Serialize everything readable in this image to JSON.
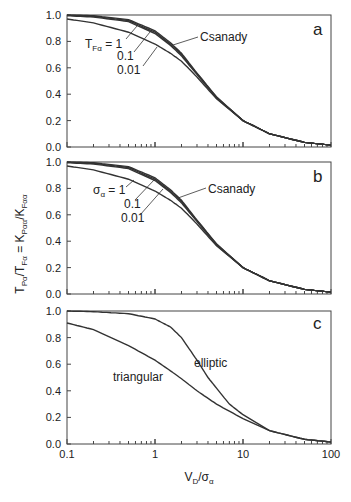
{
  "chart_data": [
    {
      "panel": "a",
      "type": "line",
      "xscale": "log",
      "xlim": [
        0.1,
        100
      ],
      "ylim": [
        0,
        1
      ],
      "yticks": [
        "0.0",
        "0.2",
        "0.4",
        "0.6",
        "0.8",
        "1.0"
      ],
      "xlabel": "V_D/σ_α",
      "ylabel": "T_Pα/T_Fα = K_Pαα/K_Fαα",
      "legend_title": "T_Fα = 1",
      "annotations": [
        "T_Fα = 1",
        "0.1",
        "0.01",
        "Csanady"
      ],
      "series": [
        {
          "name": "Csanady",
          "x": [
            0.1,
            0.2,
            0.5,
            1,
            1.5,
            2,
            3,
            5,
            10,
            20,
            50,
            100
          ],
          "y": [
            1.0,
            0.995,
            0.965,
            0.88,
            0.79,
            0.71,
            0.56,
            0.38,
            0.2,
            0.1,
            0.035,
            0.015
          ]
        },
        {
          "name": "T_Fα = 1",
          "x": [
            0.1,
            0.2,
            0.5,
            1,
            1.5,
            2,
            3,
            5,
            10,
            20,
            50,
            100
          ],
          "y": [
            0.998,
            0.99,
            0.958,
            0.87,
            0.78,
            0.7,
            0.555,
            0.375,
            0.2,
            0.1,
            0.035,
            0.015
          ]
        },
        {
          "name": "T_Fα = 0.1",
          "x": [
            0.1,
            0.2,
            0.5,
            1,
            1.5,
            2,
            3,
            5,
            10,
            20,
            50,
            100
          ],
          "y": [
            0.995,
            0.985,
            0.95,
            0.86,
            0.77,
            0.69,
            0.55,
            0.372,
            0.2,
            0.1,
            0.035,
            0.015
          ]
        },
        {
          "name": "T_Fα = 0.01",
          "x": [
            0.1,
            0.2,
            0.5,
            1,
            1.5,
            2,
            3,
            5,
            10,
            20,
            50,
            100
          ],
          "y": [
            0.97,
            0.94,
            0.87,
            0.78,
            0.71,
            0.65,
            0.53,
            0.365,
            0.2,
            0.1,
            0.035,
            0.015
          ]
        }
      ]
    },
    {
      "panel": "b",
      "type": "line",
      "xscale": "log",
      "xlim": [
        0.1,
        100
      ],
      "ylim": [
        0,
        1
      ],
      "annotations": [
        "σ_α = 1",
        "0.1",
        "0.01",
        "Csanady"
      ],
      "series": [
        {
          "name": "Csanady",
          "x": [
            0.1,
            0.2,
            0.5,
            1,
            1.5,
            2,
            3,
            5,
            10,
            20,
            50,
            100
          ],
          "y": [
            1.0,
            0.995,
            0.965,
            0.88,
            0.79,
            0.71,
            0.56,
            0.38,
            0.2,
            0.1,
            0.035,
            0.015
          ]
        },
        {
          "name": "σ_α = 1",
          "x": [
            0.1,
            0.2,
            0.5,
            1,
            1.5,
            2,
            3,
            5,
            10,
            20,
            50,
            100
          ],
          "y": [
            0.998,
            0.99,
            0.958,
            0.87,
            0.78,
            0.7,
            0.555,
            0.375,
            0.2,
            0.1,
            0.035,
            0.015
          ]
        },
        {
          "name": "σ_α = 0.1",
          "x": [
            0.1,
            0.2,
            0.5,
            1,
            1.5,
            2,
            3,
            5,
            10,
            20,
            50,
            100
          ],
          "y": [
            0.995,
            0.985,
            0.95,
            0.86,
            0.77,
            0.69,
            0.55,
            0.372,
            0.2,
            0.1,
            0.035,
            0.015
          ]
        },
        {
          "name": "σ_α = 0.01",
          "x": [
            0.1,
            0.2,
            0.5,
            1,
            1.5,
            2,
            3,
            5,
            10,
            20,
            50,
            100
          ],
          "y": [
            0.97,
            0.94,
            0.87,
            0.78,
            0.71,
            0.65,
            0.53,
            0.365,
            0.2,
            0.1,
            0.035,
            0.015
          ]
        }
      ]
    },
    {
      "panel": "c",
      "type": "line",
      "xscale": "log",
      "xlim": [
        0.1,
        100
      ],
      "ylim": [
        0,
        1
      ],
      "xticks": [
        "0.1",
        "1",
        "10",
        "100"
      ],
      "annotations": [
        "elliptic",
        "triangular"
      ],
      "series": [
        {
          "name": "elliptic",
          "x": [
            0.1,
            0.2,
            0.5,
            1,
            1.5,
            2,
            3,
            4,
            5,
            7,
            10,
            20,
            50,
            100
          ],
          "y": [
            1.0,
            0.995,
            0.98,
            0.94,
            0.88,
            0.8,
            0.63,
            0.5,
            0.42,
            0.3,
            0.22,
            0.1,
            0.035,
            0.015
          ]
        },
        {
          "name": "triangular",
          "x": [
            0.1,
            0.2,
            0.5,
            1,
            1.5,
            2,
            3,
            5,
            10,
            20,
            50,
            100
          ],
          "y": [
            0.91,
            0.86,
            0.74,
            0.63,
            0.55,
            0.49,
            0.4,
            0.3,
            0.19,
            0.1,
            0.035,
            0.015
          ]
        }
      ]
    }
  ],
  "labels": {
    "panel_a": "a",
    "panel_b": "b",
    "panel_c": "c",
    "a_ann_1": "T",
    "a_ann_1_sub": "Fα",
    "a_ann_1_tail": " = 1",
    "ann_01": "0.1",
    "ann_001": "0.01",
    "csanady": "Csanady",
    "b_ann_1": "σ",
    "b_ann_1_sub": "α",
    "b_ann_1_tail": " = 1",
    "elliptic": "elliptic",
    "triangular": "triangular",
    "xlabel_main": "V",
    "xlabel_sub1": "D",
    "xlabel_mid": "/σ",
    "xlabel_sub2": "α",
    "ylabel": "T_Pα/T_Fα = K_Pαα/K_Fαα",
    "yticks": [
      "0.0",
      "0.2",
      "0.4",
      "0.6",
      "0.8",
      "1.0"
    ],
    "xticks": [
      "0.1",
      "1",
      "10",
      "100"
    ]
  },
  "layout": {
    "x0": 67,
    "x1": 331,
    "panels": [
      [
        15,
        147
      ],
      [
        162,
        294
      ],
      [
        311,
        444
      ]
    ]
  }
}
